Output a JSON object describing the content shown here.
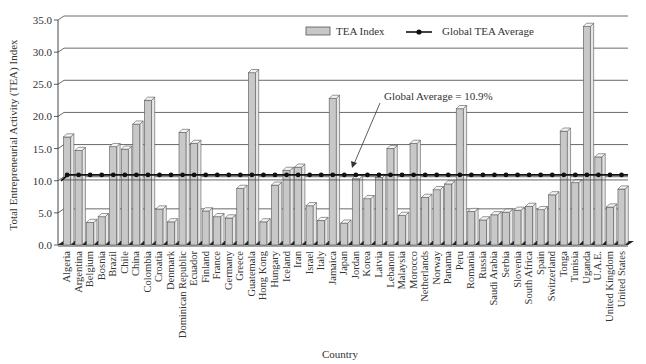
{
  "chart_data": {
    "type": "bar",
    "title": "",
    "xlabel": "Country",
    "ylabel": "Total Entrepreneurial Activity (TEA) Index",
    "ylim": [
      0,
      35
    ],
    "yticks": [
      "0.0",
      "5.0",
      "10.0",
      "15.0",
      "20.0",
      "25.0",
      "30.0",
      "35.0"
    ],
    "grid": true,
    "legend_position": "top-right",
    "categories": [
      "Algeria",
      "Argentina",
      "Belgium",
      "Bosnia",
      "Brazil",
      "Chile",
      "China",
      "Colombia",
      "Croatia",
      "Denmark",
      "Dominican Republic",
      "Ecuador",
      "Finland",
      "France",
      "Germany",
      "Greece",
      "Guatemala",
      "Hong Kong",
      "Hungary",
      "Iceland",
      "Iran",
      "Israel",
      "Italy",
      "Jamaica",
      "Japan",
      "Jordan",
      "Korea",
      "Latvia",
      "Lebanon",
      "Malaysia",
      "Morocco",
      "Netherlands",
      "Norway",
      "Panama",
      "Peru",
      "Romania",
      "Russia",
      "Saudi Arabia",
      "Serbia",
      "Slovenia",
      "South Africa",
      "Spain",
      "Switzerland",
      "Tonga",
      "Tunisia",
      "Uganda",
      "U.A.E.",
      "United Kingdom",
      "United States"
    ],
    "series": [
      {
        "name": "TEA Index",
        "type": "bar",
        "color": "#c8c8c8",
        "values": [
          16.8,
          14.7,
          3.5,
          4.4,
          15.3,
          14.9,
          18.8,
          22.5,
          5.6,
          3.6,
          17.5,
          15.8,
          5.3,
          4.4,
          4.2,
          8.8,
          26.8,
          3.6,
          9.3,
          11.6,
          12.1,
          6.1,
          3.8,
          22.8,
          3.4,
          10.3,
          7.2,
          10.5,
          15.0,
          4.6,
          15.8,
          7.4,
          8.6,
          9.5,
          21.2,
          5.2,
          3.9,
          4.7,
          5.1,
          5.4,
          6.0,
          5.5,
          7.8,
          17.7,
          9.7,
          34.0,
          13.7,
          5.9,
          8.7
        ]
      },
      {
        "name": "Global TEA Average",
        "type": "line",
        "color": "#111111",
        "value": 10.9
      }
    ],
    "annotations": [
      {
        "text": "Global Average = 10.9%"
      }
    ]
  }
}
